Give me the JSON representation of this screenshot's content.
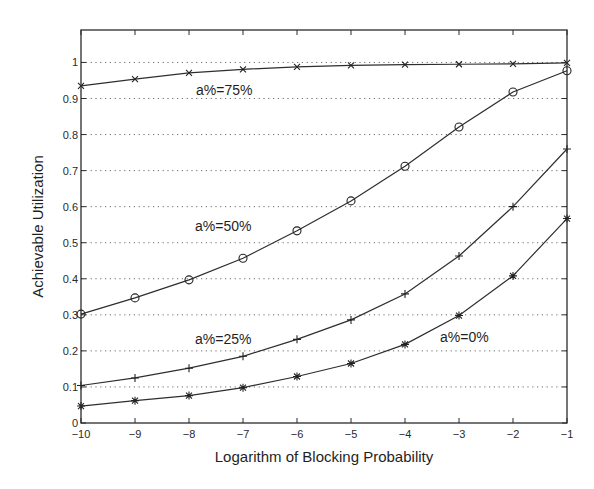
{
  "chart_data": {
    "type": "line",
    "title": "",
    "xlabel": "Logarithm of Blocking Probability",
    "ylabel": "Achievable Utilization",
    "x": [
      -10,
      -9,
      -8,
      -7,
      -6,
      -5,
      -4,
      -3,
      -2,
      -1
    ],
    "xlim": [
      -10,
      -1
    ],
    "ylim": [
      0,
      1.09
    ],
    "xticks": [
      -10,
      -9,
      -8,
      -7,
      -6,
      -5,
      -4,
      -3,
      -2,
      -1
    ],
    "xtick_labels": [
      "−10",
      "−9",
      "−8",
      "−7",
      "−6",
      "−5",
      "−4",
      "−3",
      "−2",
      "−1"
    ],
    "yticks": [
      0,
      0.1,
      0.2,
      0.3,
      0.4,
      0.5,
      0.6,
      0.7,
      0.8,
      0.9,
      1
    ],
    "ytick_labels": [
      "0",
      "0.1",
      "0.2",
      "0.3",
      "0.4",
      "0.5",
      "0.6",
      "0.7",
      "0.8",
      "0.9",
      "1"
    ],
    "grid": {
      "horizontal": true,
      "vertical": false,
      "style": "dotted"
    },
    "legend": "none (inline annotations)",
    "series": [
      {
        "name": "a%=75%",
        "marker": "x",
        "values": [
          0.935,
          0.954,
          0.971,
          0.981,
          0.988,
          0.992,
          0.994,
          0.995,
          0.996,
          0.999
        ],
        "annotation": {
          "text": "a%=75%",
          "x": 196,
          "y": 95
        }
      },
      {
        "name": "a%=50%",
        "marker": "o",
        "values": [
          0.302,
          0.347,
          0.397,
          0.457,
          0.533,
          0.616,
          0.712,
          0.821,
          0.918,
          0.977
        ],
        "annotation": {
          "text": "a%=50%",
          "x": 195,
          "y": 231
        }
      },
      {
        "name": "a%=25%",
        "marker": "+",
        "values": [
          0.104,
          0.125,
          0.152,
          0.185,
          0.232,
          0.286,
          0.358,
          0.463,
          0.6,
          0.76
        ],
        "annotation": {
          "text": "a%=25%",
          "x": 195,
          "y": 344
        }
      },
      {
        "name": "a%=0%",
        "marker": "*",
        "values": [
          0.047,
          0.062,
          0.076,
          0.098,
          0.129,
          0.165,
          0.218,
          0.298,
          0.408,
          0.567
        ],
        "annotation": {
          "text": "a%=0%",
          "x": 440,
          "y": 342
        }
      }
    ]
  },
  "layout": {
    "plot_left": 81,
    "plot_right": 567,
    "plot_top": 30,
    "plot_bottom": 423
  }
}
